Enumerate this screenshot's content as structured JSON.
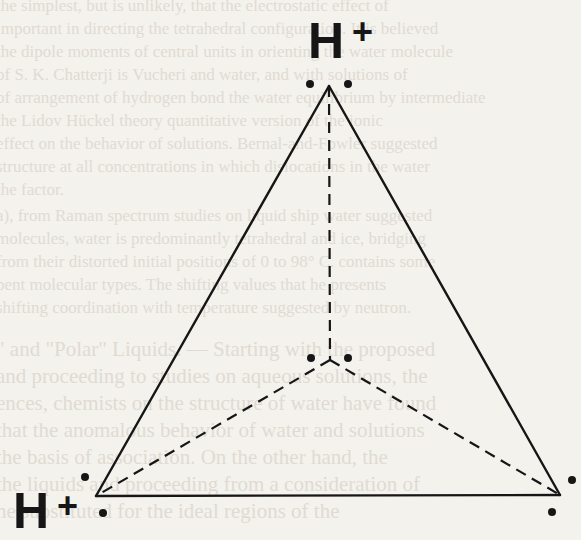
{
  "diagram": {
    "vertices": {
      "apex": {
        "x": 329,
        "y": 86,
        "label": "H+"
      },
      "bottom_left": {
        "x": 96,
        "y": 496,
        "label": "H+"
      },
      "bottom_right": {
        "x": 560,
        "y": 495,
        "label": ""
      },
      "center": {
        "x": 330,
        "y": 360,
        "label": ""
      }
    },
    "labels": {
      "top": {
        "element": "H",
        "charge": "+"
      },
      "bottom_left": {
        "element": "H",
        "charge": "+"
      }
    },
    "solid_edges": [
      [
        "apex",
        "bottom_left"
      ],
      [
        "apex",
        "bottom_right"
      ],
      [
        "bottom_left",
        "bottom_right"
      ]
    ],
    "dashed_edges": [
      [
        "apex",
        "center"
      ],
      [
        "center",
        "bottom_left"
      ],
      [
        "center",
        "bottom_right"
      ]
    ],
    "electron_dots": [
      {
        "near": "apex",
        "points": [
          [
            310,
            84
          ],
          [
            348,
            84
          ]
        ]
      },
      {
        "near": "center",
        "points": [
          [
            311,
            358
          ],
          [
            348,
            358
          ]
        ]
      },
      {
        "near": "bottom_left",
        "points": [
          [
            85,
            477
          ],
          [
            103,
            513
          ]
        ]
      },
      {
        "near": "bottom_right",
        "points": [
          [
            572,
            480
          ],
          [
            552,
            512
          ]
        ]
      }
    ],
    "colors": {
      "ink": "#161616",
      "paper": "#f4f2ed",
      "bleed_text": "#dcd8cf"
    }
  },
  "bleed_through_text": [
    "the simplest, but is unlikely, that the electrostatic effect of",
    "important in directing the tetrahedral configuration. It is believed",
    "the dipole moments of central units in orienting the water molecule",
    "of S. K. Chatterji is Vucheri and water, and with solutions of",
    "of arrangement of hydrogen bond the water equilibrium by intermediate",
    "the Lidov Hückel theory quantitative version of the ionic",
    "effect on the behavior of solutions. Bernal-and-Fowler suggested",
    "structure at all concentrations in which dislocations in the water",
    "the factor.",
    "a), from Raman spectrum studies on liquid ship water suggested",
    "molecules, water is predominantly tetrahedral and ice, bridging",
    "from their distorted initial positions of 0 to 98° C. contains some",
    "bent molecular types. The shifting values that he presents",
    "shifting coordination with temperature suggested by neutron.",
    "",
    "\" and \"Polar\" Liquids. — Starting with the proposed",
    "and proceeding to studies on aqueous solutions, the",
    "ences, chemists on the structure of water have found",
    "that the anomalous behavior of water and solutions",
    "the basis of association. On the other hand, the",
    "the liquids and proceeding from a consideration of",
    "he substituted for the ideal regions of the"
  ]
}
